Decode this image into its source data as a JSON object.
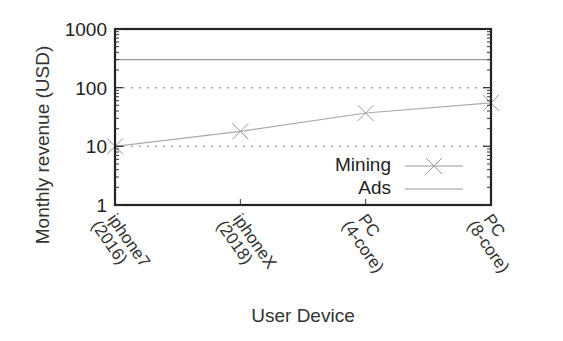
{
  "chart_data": {
    "type": "line",
    "title": "",
    "xlabel": "User Device",
    "ylabel": "Monthly revenue (USD)",
    "yscale": "log",
    "ylim": [
      1,
      1000
    ],
    "yticks": [
      "1",
      "10",
      "100",
      "1000"
    ],
    "grid": "horizontal dotted at 10 and 100",
    "categories": [
      [
        "iphone7",
        "(2016)"
      ],
      [
        "iphoneX",
        "(2018)"
      ],
      [
        "PC",
        "(4-core)"
      ],
      [
        "PC",
        "(8-core)"
      ]
    ],
    "series": [
      {
        "name": "Mining",
        "marker": "x",
        "values": [
          10,
          18,
          37,
          55
        ]
      },
      {
        "name": "Ads",
        "marker": "none",
        "values": [
          300,
          300,
          300,
          300
        ]
      }
    ],
    "legend": {
      "position": "lower right inside",
      "entries": [
        "Mining",
        "Ads"
      ]
    }
  }
}
